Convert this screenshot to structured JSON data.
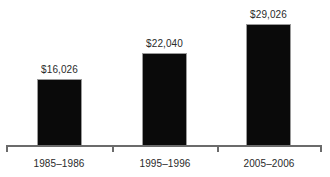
{
  "chart_data": {
    "type": "bar",
    "title": "",
    "subtitle": "",
    "xlabel": "",
    "ylabel": "",
    "categories": [
      "1985–1986",
      "1995–1996",
      "2005–2006"
    ],
    "values": [
      16026,
      22040,
      29026
    ],
    "value_labels": [
      "$16,026",
      "$22,040",
      "$29,026"
    ],
    "series": [
      {
        "name": "",
        "values": [
          16026,
          22040,
          29026
        ]
      }
    ],
    "ylim": [
      0,
      34700
    ],
    "grid": false,
    "legend": null,
    "legend_position": "none",
    "annotations": [],
    "bar_color": "#0a0a0a",
    "axis_color": "#6b6b6b",
    "text_color": "#2a2a2a",
    "background_color": "#ffffff",
    "axis_ticks": [
      "start",
      "between-1-2",
      "between-2-3",
      "end"
    ],
    "y_axis_visible": false,
    "data_labels_visible": true
  }
}
